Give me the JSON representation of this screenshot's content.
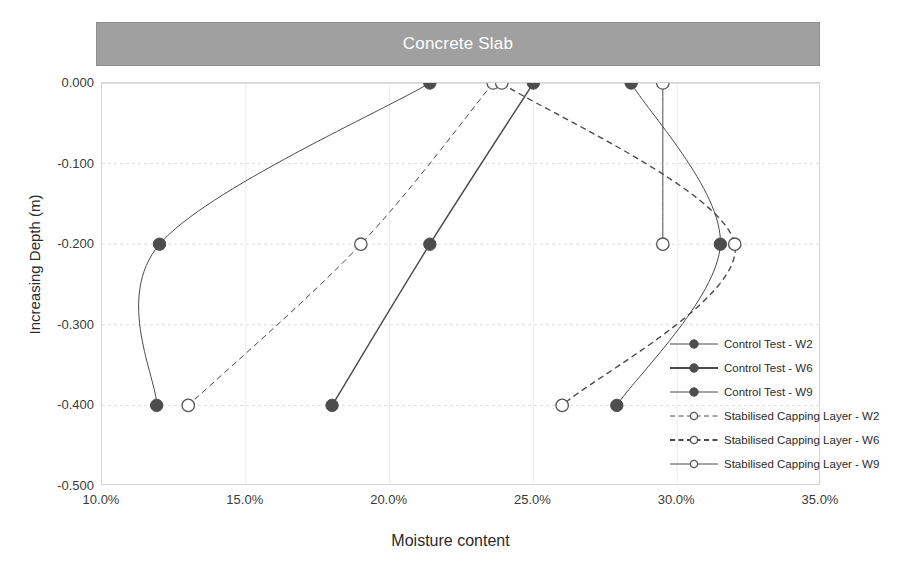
{
  "slab": {
    "label": "Concrete Slab",
    "color": "#a0a0a0",
    "text_color": "#ffffff"
  },
  "axes": {
    "xlabel": "Moisture content",
    "ylabel": "Increasing Depth (m)",
    "xticks": [
      "10.0%",
      "15.0%",
      "20.0%",
      "25.0%",
      "30.0%",
      "35.0%"
    ],
    "yticks": [
      "0.000",
      "-0.100",
      "-0.200",
      "-0.300",
      "-0.400",
      "-0.500"
    ]
  },
  "legend": {
    "items": [
      {
        "label": "Control Test - W2",
        "style": "solid",
        "marker": "filled",
        "width": 1
      },
      {
        "label": "Control Test - W6",
        "style": "solid",
        "marker": "filled",
        "width": 2
      },
      {
        "label": "Control Test - W9",
        "style": "solid",
        "marker": "filled",
        "width": 1
      },
      {
        "label": "Stabilised Capping Layer - W2",
        "style": "dashed",
        "marker": "hollow",
        "width": 1
      },
      {
        "label": "Stabilised Capping Layer - W6",
        "style": "dashed",
        "marker": "hollow",
        "width": 2
      },
      {
        "label": "Stabilised Capping Layer - W9",
        "style": "solid",
        "marker": "hollow",
        "width": 1
      }
    ]
  },
  "chart_data": {
    "type": "line",
    "title": "",
    "xlabel": "Moisture content",
    "ylabel": "Increasing Depth (m)",
    "xlim": [
      10.0,
      35.0
    ],
    "ylim": [
      -0.5,
      0.0
    ],
    "xunit": "percent",
    "grid": true,
    "legend_position": "right-inside",
    "series": [
      {
        "name": "Control Test - W2",
        "style": "solid",
        "marker": "filled",
        "x": [
          21.4,
          12.0,
          11.9
        ],
        "y": [
          0.0,
          -0.2,
          -0.4
        ]
      },
      {
        "name": "Control Test - W6",
        "style": "solid",
        "marker": "filled",
        "x": [
          25.0,
          21.4,
          18.0
        ],
        "y": [
          0.0,
          -0.2,
          -0.4
        ]
      },
      {
        "name": "Control Test - W9",
        "style": "solid",
        "marker": "filled",
        "x": [
          28.4,
          31.5,
          27.9
        ],
        "y": [
          0.0,
          -0.2,
          -0.4
        ]
      },
      {
        "name": "Stabilised Capping Layer - W2",
        "style": "dashed",
        "marker": "hollow",
        "x": [
          23.6,
          19.0,
          13.0
        ],
        "y": [
          0.0,
          -0.2,
          -0.4
        ]
      },
      {
        "name": "Stabilised Capping Layer - W6",
        "style": "dashed",
        "marker": "hollow",
        "x": [
          23.9,
          32.0,
          26.0
        ],
        "y": [
          0.0,
          -0.2,
          -0.4
        ]
      },
      {
        "name": "Stabilised Capping Layer - W9",
        "style": "solid",
        "marker": "hollow",
        "x": [
          29.5,
          29.5
        ],
        "y": [
          0.0,
          -0.2
        ]
      }
    ]
  }
}
